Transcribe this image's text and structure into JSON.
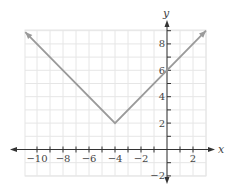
{
  "chart_data": {
    "type": "line",
    "title": "",
    "function": "y = |x + 4| + 2",
    "xlabel": "x",
    "ylabel": "y",
    "xlim": [
      -10.75,
      3
    ],
    "ylim": [
      -2.0,
      9
    ],
    "grid": true,
    "x_ticks": [
      -10,
      -9,
      -8,
      -7,
      -6,
      -5,
      -4,
      -3,
      -2,
      -1,
      1,
      2
    ],
    "x_tick_labels": [
      {
        "value": -10,
        "label": "−10"
      },
      {
        "value": -8,
        "label": "−8"
      },
      {
        "value": -6,
        "label": "−6"
      },
      {
        "value": -4,
        "label": "−4"
      },
      {
        "value": -2,
        "label": "−2"
      },
      {
        "value": 2,
        "label": "2"
      }
    ],
    "y_ticks": [
      -2,
      -1,
      1,
      2,
      3,
      4,
      5,
      6,
      7,
      8,
      9
    ],
    "y_tick_labels": [
      {
        "value": 8,
        "label": "8"
      },
      {
        "value": 6,
        "label": "6"
      },
      {
        "value": 4,
        "label": "4"
      },
      {
        "value": 2,
        "label": "2"
      },
      {
        "value": -2,
        "label": "−2"
      }
    ],
    "series": [
      {
        "name": "y = |x + 4| + 2",
        "x": [
          -10.9,
          -4,
          3
        ],
        "y": [
          8.9,
          2,
          9
        ],
        "color": "#9a9a9a",
        "arrows_at_ends": true
      }
    ],
    "key_points": {
      "vertex": [
        -4,
        2
      ],
      "y_intercept": [
        0,
        6
      ]
    }
  },
  "colors": {
    "curve": "#9a9a9a",
    "axis": "#333333",
    "grid": "#e6e6e6"
  }
}
